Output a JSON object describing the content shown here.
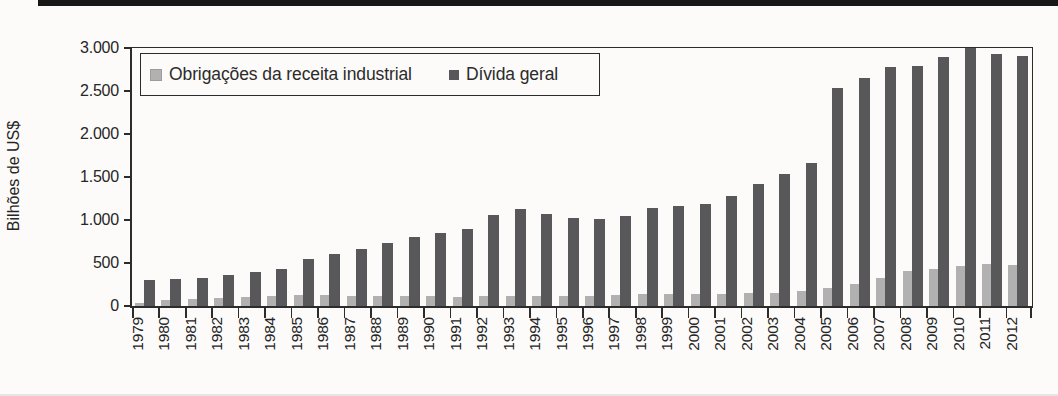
{
  "figure": {
    "kind": "scanned textbook bar chart",
    "background": "#fcfbf9",
    "top_rule_color": "#171717"
  },
  "colors": {
    "series_light": "#b2b1b1",
    "series_light_border": "#9d9c9c",
    "series_dark": "#58575a",
    "axis": "#2c2c2c",
    "text": "#262626"
  },
  "chart_data": {
    "type": "bar",
    "title": "",
    "xlabel": "",
    "ylabel": "Bilhões de US$",
    "ylim": [
      0,
      3000
    ],
    "ytick_values": [
      0,
      500,
      1000,
      1500,
      2000,
      2500,
      3000
    ],
    "ytick_labels": [
      "0",
      "500",
      "1.000",
      "1.500",
      "2.000",
      "2.500",
      "3.000"
    ],
    "grid": false,
    "legend_position": "top-left-inside-box",
    "categories": [
      "1979",
      "1980",
      "1981",
      "1982",
      "1983",
      "1984",
      "1985",
      "1986",
      "1987",
      "1988",
      "1989",
      "1990",
      "1991",
      "1992",
      "1993",
      "1994",
      "1995",
      "1996",
      "1997",
      "1998",
      "1999",
      "2000",
      "2001",
      "2002",
      "2003",
      "2004",
      "2005",
      "2006",
      "2007",
      "2008",
      "2009",
      "2010",
      "2011",
      "2012"
    ],
    "series": [
      {
        "name": "Obrigações da receita industrial",
        "color": "#b2b1b1",
        "values": [
          40,
          65,
          80,
          95,
          105,
          115,
          130,
          125,
          120,
          120,
          115,
          115,
          110,
          115,
          120,
          120,
          115,
          120,
          130,
          135,
          135,
          140,
          145,
          150,
          155,
          175,
          205,
          255,
          325,
          405,
          435,
          465,
          485,
          480
        ]
      },
      {
        "name": "Dívida geral",
        "color": "#58575a",
        "values": [
          300,
          310,
          330,
          365,
          395,
          430,
          545,
          605,
          660,
          730,
          800,
          845,
          900,
          1060,
          1125,
          1075,
          1020,
          1015,
          1050,
          1140,
          1165,
          1185,
          1280,
          1420,
          1540,
          1660,
          2540,
          2650,
          2780,
          2790,
          2900,
          3000,
          2925,
          2910
        ]
      }
    ]
  }
}
